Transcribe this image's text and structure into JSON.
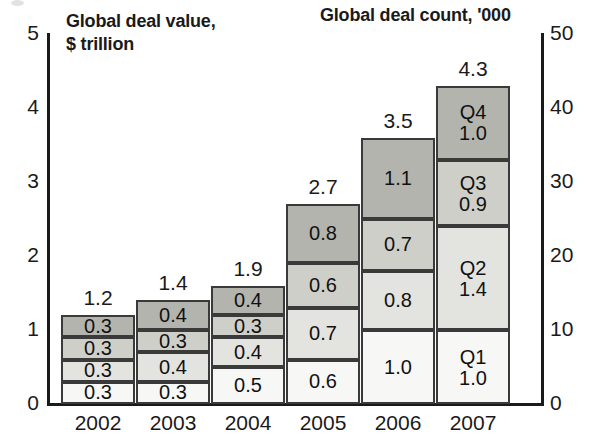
{
  "titles": {
    "left": "Global deal value,\n$ trillion",
    "right": "Global deal count, '000"
  },
  "axes": {
    "left_ticks": [
      "0",
      "1",
      "2",
      "3",
      "4",
      "5"
    ],
    "right_ticks": [
      "0",
      "10",
      "20",
      "30",
      "40",
      "50"
    ]
  },
  "colors": {
    "q1": "#f7f7f5",
    "q2": "#e3e3df",
    "q3": "#cfcfc9",
    "q4": "#b4b4ae",
    "outline": "#3a3a3a",
    "axis": "#1a1a1a",
    "text": "#1a1a1a"
  },
  "chart_data": {
    "type": "bar",
    "xlabel": "",
    "ylabel": "Global deal value, $ trillion",
    "y2label": "Global deal count, '000",
    "ylim": [
      0,
      5
    ],
    "y2lim": [
      0,
      50
    ],
    "grid": false,
    "legend": "none",
    "stacked": true,
    "categories": [
      "2002",
      "2003",
      "2004",
      "2005",
      "2006",
      "2007"
    ],
    "series": [
      {
        "name": "Q1",
        "values": [
          0.3,
          0.3,
          0.5,
          0.6,
          1.0,
          1.0
        ]
      },
      {
        "name": "Q2",
        "values": [
          0.3,
          0.4,
          0.4,
          0.7,
          0.8,
          1.4
        ]
      },
      {
        "name": "Q3",
        "values": [
          0.3,
          0.3,
          0.3,
          0.6,
          0.7,
          0.9
        ]
      },
      {
        "name": "Q4",
        "values": [
          0.3,
          0.4,
          0.4,
          0.8,
          1.1,
          1.0
        ]
      }
    ],
    "totals": [
      1.2,
      1.4,
      1.9,
      2.7,
      3.5,
      4.3
    ],
    "total_labels": [
      "1.2",
      "1.4",
      "1.9",
      "2.7",
      "3.5",
      "4.3"
    ],
    "bars": [
      {
        "year": "2002",
        "total_label": "1.2",
        "segments": [
          {
            "quarter": "Q1",
            "value": 0.3,
            "label": "0.3",
            "show_quarter": false
          },
          {
            "quarter": "Q2",
            "value": 0.3,
            "label": "0.3",
            "show_quarter": false
          },
          {
            "quarter": "Q3",
            "value": 0.3,
            "label": "0.3",
            "show_quarter": false
          },
          {
            "quarter": "Q4",
            "value": 0.3,
            "label": "0.3",
            "show_quarter": false
          }
        ]
      },
      {
        "year": "2003",
        "total_label": "1.4",
        "segments": [
          {
            "quarter": "Q1",
            "value": 0.3,
            "label": "0.3",
            "show_quarter": false
          },
          {
            "quarter": "Q2",
            "value": 0.4,
            "label": "0.4",
            "show_quarter": false
          },
          {
            "quarter": "Q3",
            "value": 0.3,
            "label": "0.3",
            "show_quarter": false
          },
          {
            "quarter": "Q4",
            "value": 0.4,
            "label": "0.4",
            "show_quarter": false
          }
        ]
      },
      {
        "year": "2004",
        "total_label": "1.9",
        "segments": [
          {
            "quarter": "Q1",
            "value": 0.5,
            "label": "0.5",
            "show_quarter": false
          },
          {
            "quarter": "Q2",
            "value": 0.4,
            "label": "0.4",
            "show_quarter": false
          },
          {
            "quarter": "Q3",
            "value": 0.3,
            "label": "0.3",
            "show_quarter": false
          },
          {
            "quarter": "Q4",
            "value": 0.4,
            "label": "0.4",
            "show_quarter": false
          }
        ]
      },
      {
        "year": "2005",
        "total_label": "2.7",
        "segments": [
          {
            "quarter": "Q1",
            "value": 0.6,
            "label": "0.6",
            "show_quarter": false
          },
          {
            "quarter": "Q2",
            "value": 0.7,
            "label": "0.7",
            "show_quarter": false
          },
          {
            "quarter": "Q3",
            "value": 0.6,
            "label": "0.6",
            "show_quarter": false
          },
          {
            "quarter": "Q4",
            "value": 0.8,
            "label": "0.8",
            "show_quarter": false
          }
        ]
      },
      {
        "year": "2006",
        "total_label": "3.5",
        "segments": [
          {
            "quarter": "Q1",
            "value": 1.0,
            "label": "1.0",
            "show_quarter": false
          },
          {
            "quarter": "Q2",
            "value": 0.8,
            "label": "0.8",
            "show_quarter": false
          },
          {
            "quarter": "Q3",
            "value": 0.7,
            "label": "0.7",
            "show_quarter": false
          },
          {
            "quarter": "Q4",
            "value": 1.1,
            "label": "1.1",
            "show_quarter": false
          }
        ]
      },
      {
        "year": "2007",
        "total_label": "4.3",
        "segments": [
          {
            "quarter": "Q1",
            "value": 1.0,
            "label": "1.0",
            "show_quarter": true
          },
          {
            "quarter": "Q2",
            "value": 1.4,
            "label": "1.4",
            "show_quarter": true
          },
          {
            "quarter": "Q3",
            "value": 0.9,
            "label": "0.9",
            "show_quarter": true
          },
          {
            "quarter": "Q4",
            "value": 1.0,
            "label": "1.0",
            "show_quarter": true
          }
        ]
      }
    ]
  }
}
